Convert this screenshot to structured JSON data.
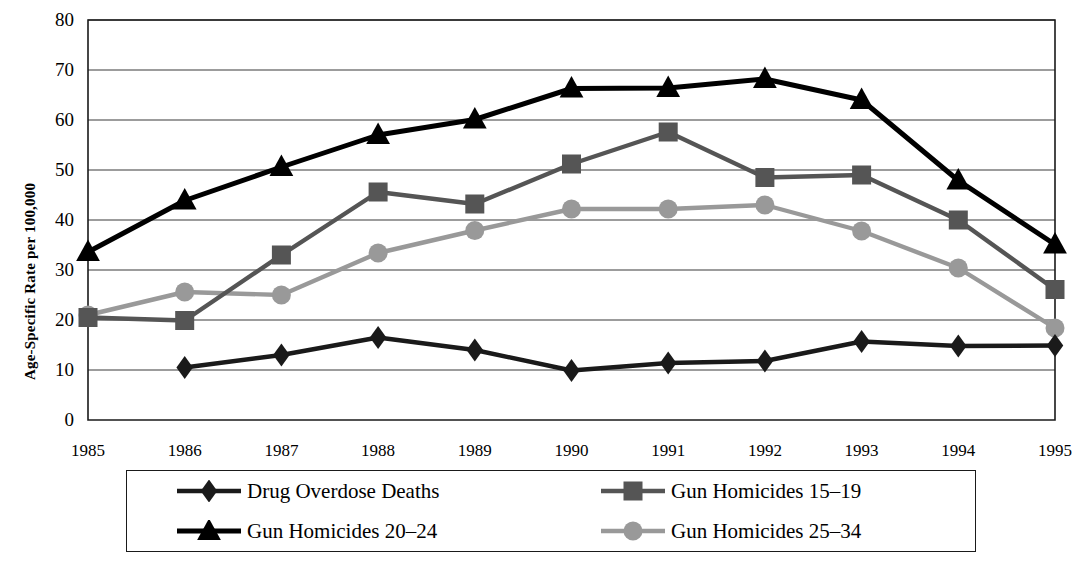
{
  "chart_data": {
    "type": "line",
    "title": "",
    "subtitle": "",
    "xlabel": "",
    "ylabel": "Age-Specific Rate per 100,000",
    "categories": [
      "1985",
      "1986",
      "1987",
      "1988",
      "1989",
      "1990",
      "1991",
      "1992",
      "1993",
      "1994",
      "1995"
    ],
    "x": [
      1985,
      1986,
      1987,
      1988,
      1989,
      1990,
      1991,
      1992,
      1993,
      1994,
      1995
    ],
    "ylim": [
      0,
      80
    ],
    "ytick_labels": [
      "0",
      "10",
      "20",
      "30",
      "40",
      "50",
      "60",
      "70",
      "80"
    ],
    "ytick_values": [
      0,
      10,
      20,
      30,
      40,
      50,
      60,
      70,
      80
    ],
    "grid": "horizontal",
    "legend_position": "bottom",
    "series": [
      {
        "name": "Drug Overdose Deaths",
        "marker": "diamond",
        "color": "#1a1a1a",
        "values": [
          null,
          10.5,
          13.0,
          16.5,
          14.0,
          9.9,
          11.4,
          11.8,
          15.7,
          14.8,
          14.9
        ]
      },
      {
        "name": "Gun Homicides 15–19",
        "marker": "square",
        "color": "#555555",
        "values": [
          20.5,
          19.9,
          33.0,
          45.6,
          43.2,
          51.2,
          57.6,
          48.5,
          49.0,
          40.0,
          26.1
        ]
      },
      {
        "name": "Gun Homicides 20–24",
        "marker": "triangle",
        "color": "#000000",
        "values": [
          33.6,
          43.9,
          50.6,
          57.0,
          60.1,
          66.3,
          66.4,
          68.2,
          64.0,
          47.9,
          35.1
        ]
      },
      {
        "name": "Gun Homicides 25–34",
        "marker": "circle",
        "color": "#999999",
        "values": [
          21.0,
          25.6,
          25.0,
          33.4,
          37.9,
          42.2,
          42.2,
          43.0,
          37.8,
          30.4,
          18.4
        ]
      }
    ]
  },
  "axis": {
    "y_title": "Age-Specific Rate per 100,000"
  },
  "legend": {
    "entries": [
      {
        "label": "Drug Overdose Deaths",
        "marker": "diamond",
        "color": "#1a1a1a"
      },
      {
        "label": "Gun Homicides 15–19",
        "marker": "square",
        "color": "#555555"
      },
      {
        "label": "Gun Homicides 20–24",
        "marker": "triangle",
        "color": "#000000"
      },
      {
        "label": "Gun Homicides 25–34",
        "marker": "circle",
        "color": "#999999"
      }
    ]
  },
  "colors": {
    "frame": "#1a1a1a",
    "gridline": "#3a3a3a",
    "background": "#ffffff"
  }
}
